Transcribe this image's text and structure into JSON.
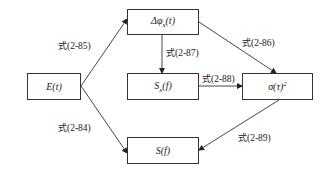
{
  "diagram": {
    "nodes": [
      {
        "id": "E",
        "label": "E(t)",
        "x": 27,
        "y": 73,
        "w": 54,
        "h": 27
      },
      {
        "id": "dphi",
        "label_main": "Δφ",
        "label_sub": "x",
        "label_tail": "(t)",
        "x": 127,
        "y": 9,
        "w": 72,
        "h": 26
      },
      {
        "id": "Sx",
        "label_main": "S",
        "label_sub": "x",
        "label_tail": "(f)",
        "x": 127,
        "y": 73,
        "w": 72,
        "h": 27
      },
      {
        "id": "sigma",
        "label_main": "σ(τ)",
        "label_sup": "2",
        "x": 242,
        "y": 73,
        "w": 71,
        "h": 27
      },
      {
        "id": "S",
        "label": "S(f)",
        "x": 127,
        "y": 137,
        "w": 72,
        "h": 27
      }
    ],
    "edges": [
      {
        "from": "E",
        "to": "dphi",
        "prefix": "式",
        "eq": "(2-85)"
      },
      {
        "from": "dphi",
        "to": "Sx",
        "prefix": "式",
        "eq": "(2-87)"
      },
      {
        "from": "dphi",
        "to": "sigma",
        "prefix": "式",
        "eq": "(2-86)"
      },
      {
        "from": "Sx",
        "to": "sigma",
        "prefix": "式",
        "eq": "(2-88)"
      },
      {
        "from": "E",
        "to": "S",
        "prefix": "式",
        "eq": "(2-84)"
      },
      {
        "from": "sigma",
        "to": "S",
        "prefix": "式",
        "eq": "(2-89)"
      }
    ]
  }
}
